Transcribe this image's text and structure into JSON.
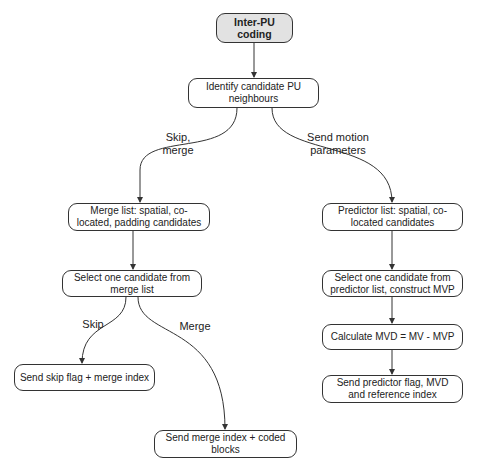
{
  "diagram": {
    "type": "flowchart",
    "nodes": {
      "start": "Inter-PU coding",
      "identify": "Identify candidate PU neighbours",
      "merge_list": "Merge list: spatial, co-located, padding candidates",
      "predictor_list": "Predictor list: spatial, co-located candidates",
      "select_merge": "Select one candidate from merge list",
      "select_predictor": "Select one candidate from predictor list, construct MVP",
      "calc_mvd": "Calculate MVD = MV - MVP",
      "send_predictor": "Send predictor flag, MVD and reference index",
      "send_skip": "Send skip flag + merge index",
      "send_merge": "Send merge index + coded blocks"
    },
    "edge_labels": {
      "skip_merge_line1": "Skip,",
      "skip_merge_line2": "merge",
      "send_motion_line1": "Send motion",
      "send_motion_line2": "parameters",
      "skip": "Skip",
      "merge": "Merge"
    },
    "edges": [
      {
        "from": "start",
        "to": "identify"
      },
      {
        "from": "identify",
        "to": "merge_list",
        "label": "Skip, merge"
      },
      {
        "from": "identify",
        "to": "predictor_list",
        "label": "Send motion parameters"
      },
      {
        "from": "merge_list",
        "to": "select_merge"
      },
      {
        "from": "select_merge",
        "to": "send_skip",
        "label": "Skip"
      },
      {
        "from": "select_merge",
        "to": "send_merge",
        "label": "Merge"
      },
      {
        "from": "predictor_list",
        "to": "select_predictor"
      },
      {
        "from": "select_predictor",
        "to": "calc_mvd"
      },
      {
        "from": "calc_mvd",
        "to": "send_predictor"
      }
    ],
    "colors": {
      "start_fill": "#e2e2e2",
      "stroke": "#333333"
    }
  }
}
